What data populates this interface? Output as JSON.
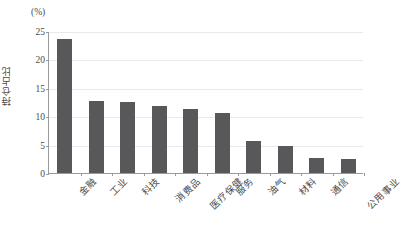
{
  "chart_data": {
    "type": "bar",
    "title": "",
    "subtitle": "",
    "xlabel": "",
    "ylabel": "持仓占比",
    "unit_label": "(%)",
    "ylim": [
      0,
      25
    ],
    "yticks": [
      0,
      5,
      10,
      15,
      20,
      25
    ],
    "ytick_labels": [
      "0",
      "5",
      "10",
      "15",
      "20",
      "25"
    ],
    "grid": "horizontal",
    "legend": "none",
    "bar_color": "#58585a",
    "gridline_color": "#e9e9e9",
    "axis_color": "#9a9a9a",
    "categories": [
      "金融",
      "工业",
      "科技",
      "消费品",
      "医疗保健",
      "服务",
      "油气",
      "材料",
      "通信",
      "公用事业"
    ],
    "values": [
      23.6,
      12.7,
      12.5,
      11.8,
      11.3,
      10.6,
      5.7,
      4.8,
      2.7,
      2.5
    ],
    "series": [
      {
        "name": "持仓占比",
        "values": [
          23.6,
          12.7,
          12.5,
          11.8,
          11.3,
          10.6,
          5.7,
          4.8,
          2.7,
          2.5
        ]
      }
    ]
  }
}
